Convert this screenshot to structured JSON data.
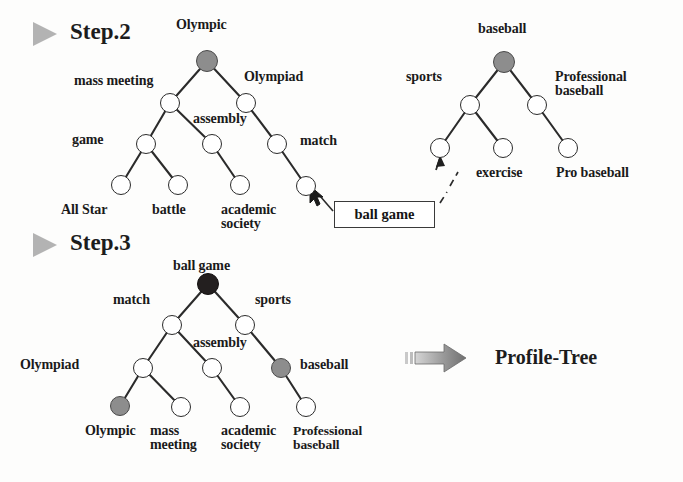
{
  "figure": {
    "title_step2": "Step.2",
    "title_step3": "Step.3",
    "result_label": "Profile-Tree",
    "callout_label": "ball game"
  },
  "step2": {
    "marker_icon": "play-triangle-icon",
    "left_tree": {
      "root_label": "Olympic",
      "labels": [
        "mass meeting",
        "Olympiad",
        "assembly",
        "match",
        "game",
        "All Star",
        "battle",
        "academic\nsociety"
      ],
      "nodes": [
        {
          "name": "olympic-root",
          "x": 207,
          "y": 61,
          "fill": "gray",
          "r": 11
        },
        {
          "name": "mass-meeting",
          "x": 170,
          "y": 103,
          "fill": "white",
          "r": 10
        },
        {
          "name": "olympiad",
          "x": 246,
          "y": 103,
          "fill": "white",
          "r": 10
        },
        {
          "name": "game",
          "x": 146,
          "y": 144,
          "fill": "white",
          "r": 10
        },
        {
          "name": "assembly",
          "x": 212,
          "y": 144,
          "fill": "white",
          "r": 10
        },
        {
          "name": "match",
          "x": 277,
          "y": 144,
          "fill": "white",
          "r": 10
        },
        {
          "name": "all-star",
          "x": 121,
          "y": 185,
          "fill": "white",
          "r": 10
        },
        {
          "name": "battle",
          "x": 178,
          "y": 185,
          "fill": "white",
          "r": 10
        },
        {
          "name": "academic-society",
          "x": 240,
          "y": 185,
          "fill": "white",
          "r": 10
        },
        {
          "name": "ball-game-target",
          "x": 306,
          "y": 186,
          "fill": "white",
          "r": 10
        }
      ],
      "edges": [
        [
          207,
          61,
          170,
          103
        ],
        [
          207,
          61,
          246,
          103
        ],
        [
          170,
          103,
          146,
          144
        ],
        [
          170,
          103,
          212,
          144
        ],
        [
          246,
          103,
          277,
          144
        ],
        [
          146,
          144,
          121,
          185
        ],
        [
          146,
          144,
          178,
          185
        ],
        [
          212,
          144,
          240,
          185
        ],
        [
          277,
          144,
          306,
          186
        ]
      ]
    },
    "right_tree": {
      "root_label": "baseball",
      "labels": [
        "sports",
        "Professional\nbaseball",
        "exercise",
        "Pro baseball"
      ],
      "nodes": [
        {
          "name": "baseball-root",
          "x": 504,
          "y": 62,
          "fill": "gray",
          "r": 11
        },
        {
          "name": "sports",
          "x": 470,
          "y": 105,
          "fill": "white",
          "r": 10
        },
        {
          "name": "professional-baseball",
          "x": 537,
          "y": 105,
          "fill": "white",
          "r": 10
        },
        {
          "name": "ball-game-source",
          "x": 440,
          "y": 148,
          "fill": "white",
          "r": 10
        },
        {
          "name": "exercise",
          "x": 503,
          "y": 148,
          "fill": "white",
          "r": 10
        },
        {
          "name": "pro-baseball",
          "x": 568,
          "y": 148,
          "fill": "white",
          "r": 10
        }
      ],
      "edges": [
        [
          504,
          62,
          470,
          105
        ],
        [
          504,
          62,
          537,
          105
        ],
        [
          470,
          105,
          440,
          148
        ],
        [
          470,
          105,
          503,
          148
        ],
        [
          537,
          105,
          568,
          148
        ]
      ]
    }
  },
  "step3": {
    "marker_icon": "play-triangle-icon",
    "tree": {
      "root_label": "ball game",
      "labels": [
        "match",
        "sports",
        "assembly",
        "Olympiad",
        "baseball",
        "Olympic",
        "mass\nmeeting",
        "academic\nsociety",
        "Professional\nbaseball"
      ],
      "nodes": [
        {
          "name": "ball-game-root",
          "x": 208,
          "y": 284,
          "fill": "black",
          "r": 11
        },
        {
          "name": "match",
          "x": 172,
          "y": 325,
          "fill": "white",
          "r": 10
        },
        {
          "name": "sports",
          "x": 245,
          "y": 325,
          "fill": "white",
          "r": 10
        },
        {
          "name": "olympiad",
          "x": 143,
          "y": 368,
          "fill": "white",
          "r": 10
        },
        {
          "name": "assembly",
          "x": 212,
          "y": 368,
          "fill": "white",
          "r": 10
        },
        {
          "name": "baseball",
          "x": 281,
          "y": 368,
          "fill": "gray",
          "r": 10
        },
        {
          "name": "olympic",
          "x": 120,
          "y": 406,
          "fill": "gray",
          "r": 10
        },
        {
          "name": "mass-meeting",
          "x": 181,
          "y": 407,
          "fill": "white",
          "r": 10
        },
        {
          "name": "academic-society",
          "x": 240,
          "y": 407,
          "fill": "white",
          "r": 10
        },
        {
          "name": "professional-baseball",
          "x": 306,
          "y": 407,
          "fill": "white",
          "r": 10
        }
      ],
      "edges": [
        [
          208,
          284,
          172,
          325
        ],
        [
          208,
          284,
          245,
          325
        ],
        [
          172,
          325,
          143,
          368
        ],
        [
          172,
          325,
          212,
          368
        ],
        [
          245,
          325,
          281,
          368
        ],
        [
          143,
          368,
          120,
          406
        ],
        [
          143,
          368,
          181,
          407
        ],
        [
          212,
          368,
          240,
          407
        ],
        [
          281,
          368,
          306,
          407
        ]
      ]
    },
    "arrow_icon": "right-arrow-icon"
  },
  "labels_placed": {
    "step2_left": [
      {
        "name": "label-olympic",
        "text": "Olympic",
        "x": 176,
        "y": 18,
        "size": "sz14"
      },
      {
        "name": "label-mass-meeting",
        "text": "mass meeting",
        "x": 74,
        "y": 74,
        "size": "sz14"
      },
      {
        "name": "label-olympiad",
        "text": "Olympiad",
        "x": 244,
        "y": 70,
        "size": "sz14"
      },
      {
        "name": "label-assembly",
        "text": "assembly",
        "x": 193,
        "y": 112,
        "size": "sz14"
      },
      {
        "name": "label-match",
        "text": "match",
        "x": 300,
        "y": 134,
        "size": "sz14"
      },
      {
        "name": "label-game",
        "text": "game",
        "x": 72,
        "y": 133,
        "size": "sz14"
      },
      {
        "name": "label-all-star",
        "text": "All Star",
        "x": 61,
        "y": 203,
        "size": "sz14"
      },
      {
        "name": "label-battle",
        "text": "battle",
        "x": 152,
        "y": 203,
        "size": "sz14"
      },
      {
        "name": "label-academic-society",
        "text": "academic\nsociety",
        "x": 221,
        "y": 203,
        "size": "sz14"
      }
    ],
    "step2_right": [
      {
        "name": "label-baseball",
        "text": "baseball",
        "x": 478,
        "y": 22,
        "size": "sz14"
      },
      {
        "name": "label-sports",
        "text": "sports",
        "x": 406,
        "y": 70,
        "size": "sz14"
      },
      {
        "name": "label-professional-baseball",
        "text": "Professional\nbaseball",
        "x": 555,
        "y": 70,
        "size": "sz14"
      },
      {
        "name": "label-exercise",
        "text": "exercise",
        "x": 476,
        "y": 166,
        "size": "sz14"
      },
      {
        "name": "label-pro-baseball",
        "text": "Pro baseball",
        "x": 556,
        "y": 166,
        "size": "sz14"
      }
    ],
    "step3": [
      {
        "name": "label-ball-game",
        "text": "ball game",
        "x": 173,
        "y": 259,
        "size": "sz14"
      },
      {
        "name": "label-match",
        "text": "match",
        "x": 113,
        "y": 293,
        "size": "sz14"
      },
      {
        "name": "label-sports",
        "text": "sports",
        "x": 255,
        "y": 293,
        "size": "sz14"
      },
      {
        "name": "label-assembly",
        "text": "assembly",
        "x": 193,
        "y": 336,
        "size": "sz14"
      },
      {
        "name": "label-olympiad",
        "text": "Olympiad",
        "x": 20,
        "y": 358,
        "size": "sz14"
      },
      {
        "name": "label-baseball",
        "text": "baseball",
        "x": 300,
        "y": 358,
        "size": "sz14"
      },
      {
        "name": "label-olympic",
        "text": "Olympic",
        "x": 85,
        "y": 424,
        "size": "sz14"
      },
      {
        "name": "label-mass-meeting",
        "text": "mass\nmeeting",
        "x": 150,
        "y": 424,
        "size": "sz14"
      },
      {
        "name": "label-academic-society",
        "text": "academic\nsociety",
        "x": 221,
        "y": 424,
        "size": "sz14"
      },
      {
        "name": "label-professional-baseball",
        "text": "Professional\nbaseball",
        "x": 293,
        "y": 424,
        "size": "sz13"
      }
    ]
  },
  "colors": {
    "ink": "#1a1a1a",
    "node_stroke": "#2b2b2b",
    "node_gray_fill": "#8d8d8d",
    "node_black_fill": "#231f1f",
    "marker_gray": "#b3b3b3",
    "arrow_gray": "#8a8a8a",
    "background": "#fdfdfc"
  }
}
